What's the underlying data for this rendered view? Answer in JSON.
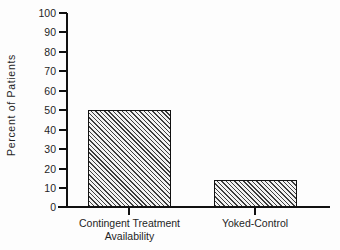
{
  "chart_data": {
    "type": "bar",
    "title": "",
    "xlabel": "",
    "ylabel": "Percent of Patients",
    "categories": [
      "Contingent Treatment Availability",
      "Yoked-Control"
    ],
    "category_lines": [
      [
        "Contingent Treatment",
        "Availability"
      ],
      [
        "Yoked-Control",
        ""
      ]
    ],
    "values": [
      50,
      14
    ],
    "ylim": [
      0,
      100
    ],
    "yticks": [
      0,
      10,
      20,
      30,
      40,
      50,
      60,
      70,
      80,
      90,
      100
    ],
    "ytick_labels": [
      "0",
      "10",
      "20",
      "30",
      "40",
      "50",
      "60",
      "70",
      "80",
      "90",
      "100"
    ],
    "grid": false,
    "legend": null,
    "bar_fill": "diagonal-hatch",
    "colors": {
      "axis": "#111111",
      "bar_hatch": "#3d3d3d",
      "bar_background": "#f2f2f2",
      "text": "#1f1f1f",
      "page_background": "#fdfdfd"
    }
  }
}
